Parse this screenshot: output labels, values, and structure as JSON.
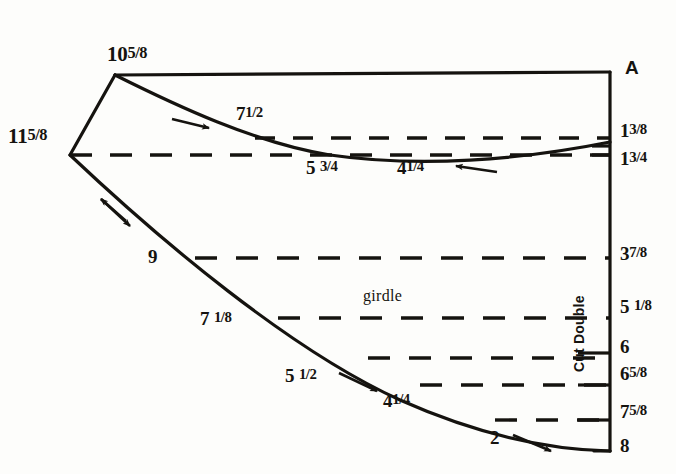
{
  "diagram": {
    "ink_color": "#15130f",
    "paper_color": "#fdfdfb"
  },
  "vertices": {
    "top_point": {
      "label_whole": "10",
      "label_frac": "5/8",
      "x": 115,
      "y": 75
    },
    "left_point": {
      "label_whole": "11",
      "label_frac": "5/8",
      "x": 57,
      "y": 153
    },
    "corner_top_right": {
      "x": 610,
      "y": 72
    },
    "corner_bottom_right": {
      "x": 610,
      "y": 451
    }
  },
  "labels": {
    "top_vertex": {
      "whole": "10",
      "frac": "5/8"
    },
    "left_vertex": {
      "whole": "11",
      "frac": "5/8"
    },
    "point_a": "A",
    "upper_curve_1": {
      "whole": "7",
      "frac": "1/2"
    },
    "upper_curve_2": {
      "whole": "5",
      "frac": "3/4"
    },
    "upper_curve_3": {
      "whole": "4",
      "frac": "1/4"
    },
    "lower_curve_1": {
      "whole": "9",
      "frac": ""
    },
    "lower_curve_2": {
      "whole": "7",
      "frac": "1/8"
    },
    "lower_curve_3": {
      "whole": "5",
      "frac": "1/2"
    },
    "lower_curve_4": {
      "whole": "4",
      "frac": "1/4"
    },
    "lower_curve_5": {
      "whole": "2",
      "frac": ""
    },
    "girdle": "girdle",
    "cut_double": "Cut Double"
  },
  "right_scale": [
    {
      "whole": "1",
      "frac": "3/8",
      "y": 132
    },
    {
      "whole": "1",
      "frac": "3/4",
      "y": 160
    },
    {
      "whole": "3",
      "frac": "7/8",
      "y": 255
    },
    {
      "whole": "5",
      "frac": "1/8",
      "y": 308
    },
    {
      "whole": "6",
      "frac": "",
      "y": 348
    },
    {
      "whole": "6",
      "frac": "5/8",
      "y": 375
    },
    {
      "whole": "7",
      "frac": "5/8",
      "y": 413
    },
    {
      "whole": "8",
      "frac": "",
      "y": 447
    }
  ],
  "dashed_lines": [
    {
      "name": "upper-inner",
      "y": 138,
      "x1": 255,
      "x2": 610
    },
    {
      "name": "center-waist",
      "y": 155,
      "x1": 70,
      "x2": 610
    },
    {
      "name": "hip-upper",
      "y": 258,
      "x1": 195,
      "x2": 610
    },
    {
      "name": "girdle-line",
      "y": 318,
      "x1": 278,
      "x2": 610
    },
    {
      "name": "lower-1",
      "y": 358,
      "x1": 368,
      "x2": 610
    },
    {
      "name": "lower-2",
      "y": 385,
      "x1": 420,
      "x2": 610
    },
    {
      "name": "lower-3",
      "y": 420,
      "x1": 495,
      "x2": 610
    }
  ],
  "arrows": [
    {
      "name": "upper-right-arrow",
      "direction": "right"
    },
    {
      "name": "upper-left-arrow",
      "direction": "left"
    },
    {
      "name": "left-double-arrow",
      "direction": "down-left-up-right"
    },
    {
      "name": "lower-right-arrow",
      "direction": "down-right"
    },
    {
      "name": "bottom-right-arrow",
      "direction": "down-right"
    }
  ]
}
